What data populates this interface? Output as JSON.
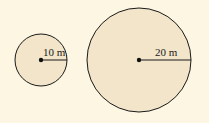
{
  "colors": {
    "background": "#fcf6e3",
    "circle_fill": "#f2e5c9",
    "stroke": "#1a1a1a"
  },
  "circles": [
    {
      "name": "small-circle",
      "cx": 41,
      "cy": 60,
      "r": 26,
      "radius_label": "10 m"
    },
    {
      "name": "large-circle",
      "cx": 139,
      "cy": 60,
      "r": 52,
      "radius_label": "20 m"
    }
  ]
}
